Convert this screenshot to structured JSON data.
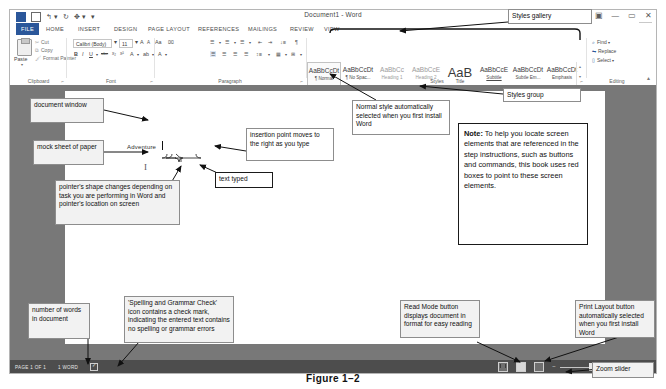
{
  "figure": {
    "caption": "Figure 1–2"
  },
  "window": {
    "title": "Document1 - Word",
    "sign_in": "Sign in",
    "controls": {
      "help": "?",
      "ribbon_display": "▣",
      "minimize": "—",
      "restore": "▭",
      "close": "✕"
    },
    "quick_access": [
      "word-icon",
      "save-icon",
      "undo-icon",
      "redo-icon",
      "touch-mode-icon",
      "customize-icon"
    ]
  },
  "tabs": [
    {
      "label": "FILE",
      "active": true
    },
    {
      "label": "HOME",
      "active": false
    },
    {
      "label": "INSERT",
      "active": false
    },
    {
      "label": "DESIGN",
      "active": false
    },
    {
      "label": "PAGE LAYOUT",
      "active": false
    },
    {
      "label": "REFERENCES",
      "active": false
    },
    {
      "label": "MAILINGS",
      "active": false
    },
    {
      "label": "REVIEW",
      "active": false
    },
    {
      "label": "VIEW",
      "active": false
    }
  ],
  "ribbon": {
    "groups": [
      {
        "name": "Clipboard",
        "label": "Clipboard"
      },
      {
        "name": "Font",
        "label": "Font"
      },
      {
        "name": "Paragraph",
        "label": "Paragraph"
      },
      {
        "name": "Styles",
        "label": "Styles"
      },
      {
        "name": "Editing",
        "label": "Editing"
      }
    ],
    "clipboard": {
      "paste": "Paste",
      "cut": "Cut",
      "copy": "Copy",
      "format_painter": "Format Painter"
    },
    "font": {
      "font_name": "Calibri (Body)",
      "font_size": "11",
      "grow": "A",
      "shrink": "A",
      "change_case": "Aa",
      "clear_formatting": "⌧",
      "bold": "B",
      "italic": "I",
      "underline": "U",
      "strikethrough": "abc",
      "subscript": "x₂",
      "superscript": "x²",
      "text_effects": "A",
      "highlight": "ab",
      "font_color": "A"
    },
    "editing": {
      "find": "Find",
      "replace": "Replace",
      "select": "Select"
    }
  },
  "styles_gallery": [
    {
      "preview": "AaBbCcDt",
      "name": "¶ Normal",
      "selected": true,
      "dim": false
    },
    {
      "preview": "AaBbCcDt",
      "name": "¶ No Spac...",
      "selected": false,
      "dim": false
    },
    {
      "preview": "AaBbCc",
      "name": "Heading 1",
      "selected": false,
      "dim": true
    },
    {
      "preview": "AaBbCcE",
      "name": "Heading 2",
      "selected": false,
      "dim": true
    },
    {
      "preview": "AaB",
      "name": "Title",
      "selected": false,
      "dim": false
    },
    {
      "preview": "AaBbCcE",
      "name": "Subtitle",
      "selected": false,
      "dim": false
    },
    {
      "preview": "AaBbCcDt",
      "name": "Subtle Em...",
      "selected": false,
      "dim": false
    },
    {
      "preview": "AaBbCcDt",
      "name": "Emphasis",
      "selected": false,
      "dim": false
    }
  ],
  "document": {
    "typed_text": "Adventure",
    "pointer_glyph": "I"
  },
  "status_bar": {
    "page": "PAGE 1 OF 1",
    "words": "1 WORD",
    "proofing_icon": "spelling-and-grammar-check-icon",
    "zoom_percent": "100%",
    "views": [
      "Read Mode",
      "Print Layout",
      "Web Layout"
    ]
  },
  "annotations": {
    "styles_gallery": "Styles gallery",
    "styles_group": "Styles group",
    "normal_style": "Normal style automatically selected when you first install Word",
    "document_window": "document window",
    "mock_sheet": "mock sheet of paper",
    "insertion_point": "insertion point moves to the right as you type",
    "text_typed": "text typed",
    "pointer_shape": "pointer's shape changes depending on task you are performing in Word and pointer's location on screen",
    "note_label": "Note:",
    "note_body": " To help you locate screen elements that are referenced in the step instructions, such as buttons and commands, this book uses red boxes to point to these screen elements.",
    "word_count": "number of words in document",
    "spelling_check": "'Spelling and Grammar Check' icon contains a check mark, indicating the entered text contains no spelling or grammar errors",
    "read_mode": "Read Mode button displays document in format for easy reading",
    "print_layout": "Print Layout button automatically selected when you first install Word",
    "zoom_slider": "Zoom slider"
  }
}
